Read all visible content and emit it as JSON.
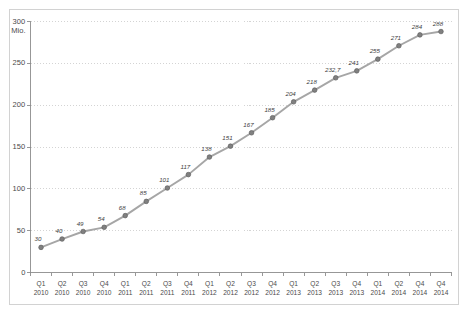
{
  "chart_data": {
    "type": "line",
    "title": "",
    "xlabel": "",
    "ylabel": "",
    "unit_label": "Mio.",
    "ylim": [
      0,
      300
    ],
    "yticks": [
      0,
      50,
      100,
      150,
      200,
      250,
      300
    ],
    "ytick_labels": [
      "0",
      "50",
      "100",
      "150",
      "200",
      "250",
      "300"
    ],
    "grid": "horizontal-dotted",
    "legend": "none",
    "categories": [
      "Q1 2010",
      "Q2 2010",
      "Q3 2010",
      "Q4 2010",
      "Q1 2011",
      "Q2 2011",
      "Q3 2011",
      "Q4 2011",
      "Q1 2012",
      "Q2 2012",
      "Q3 2012",
      "Q4 2012",
      "Q1 2013",
      "Q2 2013",
      "Q3 2013",
      "Q4 2013",
      "Q1 2014",
      "Q2 2014",
      "Q4 2014",
      "Q4 2014"
    ],
    "xtick_quarters": [
      "Q1",
      "Q2",
      "Q3",
      "Q4",
      "Q1",
      "Q2",
      "Q3",
      "Q4",
      "Q1",
      "Q2",
      "Q3",
      "Q4",
      "Q1",
      "Q2",
      "Q3",
      "Q4",
      "Q1",
      "Q2",
      "Q4",
      "Q4"
    ],
    "xtick_years": [
      "2010",
      "2010",
      "2010",
      "2010",
      "2011",
      "2011",
      "2011",
      "2011",
      "2012",
      "2012",
      "2012",
      "2012",
      "2013",
      "2013",
      "2013",
      "2013",
      "2014",
      "2014",
      "2014",
      "2014"
    ],
    "values": [
      30,
      40,
      49,
      54,
      68,
      85,
      101,
      117,
      138,
      151,
      167,
      185,
      204,
      218,
      232.7,
      241,
      255,
      271,
      284,
      288
    ],
    "point_labels": [
      "30",
      "40",
      "49",
      "54",
      "68",
      "85",
      "101",
      "117",
      "138",
      "151",
      "167",
      "185",
      "204",
      "218",
      "232,7",
      "241",
      "255",
      "271",
      "284",
      "288"
    ],
    "series_name": "",
    "colors": {
      "line": "#a6a6a6",
      "marker": "#808080",
      "marker_edge": "#5f5f5f",
      "grid": "#c9c9c9",
      "axis": "#8c8c8c",
      "frame": "#d2d2d2",
      "text": "#4a4a4a",
      "label_text": "#3d3d3d",
      "background": "#ffffff"
    }
  }
}
